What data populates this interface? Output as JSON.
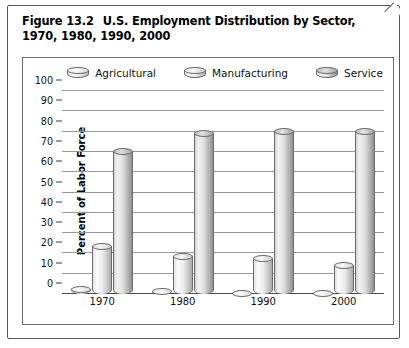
{
  "figure": {
    "number": "Figure 13.2",
    "title": "U.S. Employment Distribution by Sector, 1970, 1980, 1990, 2000"
  },
  "chart_data": {
    "type": "bar",
    "title": "U.S. Employment Distribution by Sector, 1970, 1980, 1990, 2000",
    "xlabel": "",
    "ylabel": "Percent of Labor Force",
    "categories": [
      "1970",
      "1980",
      "1990",
      "2000"
    ],
    "series": [
      {
        "name": "Agricultural",
        "values": [
          4,
          3,
          2,
          2
        ]
      },
      {
        "name": "Manufacturing",
        "values": [
          25,
          20,
          19,
          16
        ]
      },
      {
        "name": "Service",
        "values": [
          72,
          81,
          82,
          82
        ]
      }
    ],
    "ylim": [
      0,
      100
    ],
    "yticks": [
      100,
      90,
      80,
      70,
      60,
      50,
      40,
      30,
      20,
      10,
      0
    ],
    "grid": "horizontal",
    "legend_position": "top",
    "bar_style": "3d-cylinder"
  },
  "legend": {
    "items": [
      {
        "label": "Agricultural",
        "key": "agricultural",
        "swatch": "cylinder-icon",
        "color": "#f2f2f2"
      },
      {
        "label": "Manufacturing",
        "key": "manufacturing",
        "swatch": "cylinder-icon",
        "color": "#ececec"
      },
      {
        "label": "Service",
        "key": "service",
        "swatch": "cylinder-icon",
        "color": "#cfcfcf"
      }
    ]
  },
  "axes": {
    "y_title": "Percent of Labor Force",
    "y_ticks": [
      "100",
      "90",
      "80",
      "70",
      "60",
      "50",
      "40",
      "30",
      "20",
      "10",
      "0"
    ],
    "x_ticks": [
      "1970",
      "1980",
      "1990",
      "2000"
    ]
  },
  "style": {
    "border_color": "#5a5a5a",
    "gridline_color": "#9a9a9a",
    "background": "#ffffff",
    "text_color": "#111111"
  }
}
